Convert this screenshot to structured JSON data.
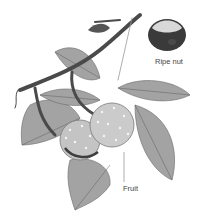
{
  "illustration": {
    "subject": "Horse chestnut branch with leaves and spiky fruit",
    "style": "grayscale botanical drawing",
    "colors": {
      "background": "#ffffff",
      "leaf": "#9a9a9a",
      "leaf_vein": "#5e5e5e",
      "branch": "#4a4a4a",
      "fruit": "#c8c8c8",
      "spike": "#f4f4f4",
      "nut_dark": "#3a3a3a",
      "nut_light": "#d8d8d8"
    }
  },
  "labels": {
    "ripe_nut": "Ripe nut",
    "fruit": "Fruit"
  }
}
